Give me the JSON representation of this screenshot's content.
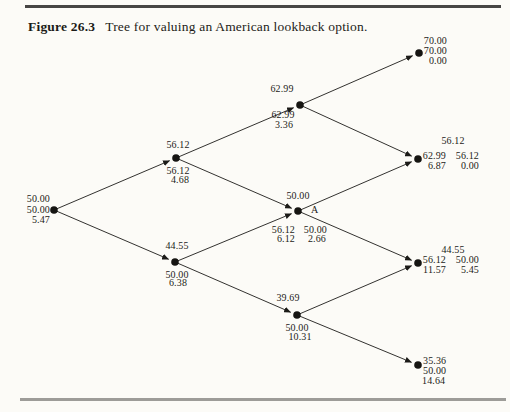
{
  "figure": {
    "label": "Figure 26.3",
    "caption": "Tree for valuing an American lookback option."
  },
  "tree": {
    "description": "Three-step binomial tree; at each node: stock price (top), maximum price(s) so far (middle), lookback option value(s) (bottom)",
    "nodes": {
      "root": {
        "stock": "50.00",
        "max": "50.00",
        "value": "5.47"
      },
      "u": {
        "stock": "56.12",
        "max": "56.12",
        "value": "4.68"
      },
      "d": {
        "stock": "44.55",
        "max": "50.00",
        "value": "6.38"
      },
      "uu": {
        "stock": "62.99",
        "max": "62.99",
        "value": "3.36"
      },
      "ud": {
        "stock": "50.00",
        "marker": "A",
        "max1": "56.12",
        "max2": "50.00",
        "value1": "6.12",
        "value2": "2.66"
      },
      "dd": {
        "stock": "39.69",
        "max": "50.00",
        "value": "10.31"
      },
      "uuu": {
        "stock": "70.00",
        "max": "70.00",
        "value": "0.00"
      },
      "uud": {
        "stock": "56.12",
        "max1": "62.99",
        "max2": "56.12",
        "value1": "6.87",
        "value2": "0.00"
      },
      "udd": {
        "stock": "44.55",
        "max1": "56.12",
        "max2": "50.00",
        "value1": "11.57",
        "value2": "5.45"
      },
      "ddd": {
        "stock": "35.36",
        "max": "50.00",
        "value": "14.64"
      }
    },
    "edges": [
      "root-u",
      "root-d",
      "u-uu",
      "u-ud",
      "d-ud",
      "d-dd",
      "uu-uuu",
      "uu-uud",
      "ud-uud",
      "ud-udd",
      "dd-udd",
      "dd-ddd"
    ]
  }
}
